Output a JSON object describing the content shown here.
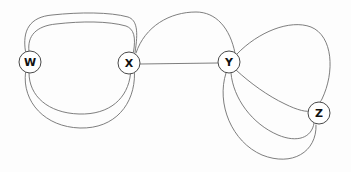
{
  "figure": {
    "kind": "multigraph-diagram",
    "background_color": "#fdfdfd",
    "edge_color": "#6f6f6f",
    "node_fill_color": "#ffffff",
    "node_stroke_color": "#4a4a4a",
    "label_color": "#111111"
  },
  "nodes": [
    {
      "id": "W",
      "label": "W",
      "cx": 30,
      "cy": 62,
      "r": 11
    },
    {
      "id": "X",
      "label": "X",
      "cx": 129,
      "cy": 63,
      "r": 11
    },
    {
      "id": "Y",
      "label": "Y",
      "cx": 229,
      "cy": 62,
      "r": 11
    },
    {
      "id": "Z",
      "label": "Z",
      "cx": 319,
      "cy": 113,
      "r": 11
    }
  ],
  "edges": [
    {
      "id": "wx-1",
      "from": "W",
      "to": "X",
      "label": "",
      "path": "M 25.5 51.5 C 22 30 30 17 52 15 C 80 12 110 12 128 17 C 137 20 138.5 31 135 52.5"
    },
    {
      "id": "wx-2",
      "from": "W",
      "to": "X",
      "label": "",
      "path": "M 29 51.2 C 27 36 36 26 56 24 C 82 21 108 21 126 26 C 134 29 136 37 133.5 52"
    },
    {
      "id": "wx-3",
      "from": "W",
      "to": "X",
      "label": "",
      "path": "M 29 73 C 29 96 48 113 79 114 C 110 115 128 98 130.5 74"
    },
    {
      "id": "wx-4",
      "from": "W",
      "to": "X",
      "label": "",
      "path": "M 25.5 72.5 C 22 102 45 127 80 128 C 115 129 135 104 134.5 73.5"
    },
    {
      "id": "xy-straight",
      "from": "X",
      "to": "Y",
      "label": "",
      "path": "M 140 64 L 218 63"
    },
    {
      "id": "xy-arc",
      "from": "X",
      "to": "Y",
      "label": "",
      "path": "M 136 53 C 145 26 170 12 196 12 C 216 12 230 28 235 53"
    },
    {
      "id": "yz-1",
      "from": "Y",
      "to": "Z",
      "label": "",
      "path": "M 236 70 C 250 83 268 96 285 104 C 297 110 308 113 311 110.5"
    },
    {
      "id": "yz-2",
      "from": "Y",
      "to": "Z",
      "label": "",
      "path": "M 231 73 C 233 98 252 124 278 135 C 297 143 312 138 314 123"
    },
    {
      "id": "yz-3",
      "from": "Y",
      "to": "Z",
      "label": "",
      "path": "M 226 73 C 216 104 232 142 262 155 C 292 167 317 152 316 125"
    },
    {
      "id": "yz-4",
      "from": "Y",
      "to": "Z",
      "label": "",
      "path": "M 237 54 C 258 32 290 19 311 27 C 333 36 335 72 322 99 C 320 103 319 103 318 102.5"
    }
  ]
}
